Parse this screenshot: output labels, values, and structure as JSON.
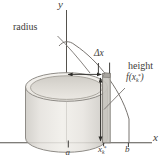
{
  "figure": {
    "axes": {
      "x_label": "x",
      "y_label": "y"
    },
    "labels": {
      "radius": "radius",
      "delta_x": "Δx",
      "height": "height",
      "fx_open": "f(x",
      "fx_sub": "k",
      "fx_sup": "*",
      "fx_close": ")",
      "a": "a",
      "xk_base": "x",
      "xk_sub": "k",
      "xk_sup": "*",
      "b": "b"
    },
    "colors": {
      "axis_line": "#55524d",
      "curve_line": "#787470",
      "arrow": "#2b2a27",
      "strip_fill": "#c8c5bf",
      "strip_edge": "#817e78",
      "cylinder_outline": "#8f8c87",
      "text": "#3e3c39",
      "background": "#ffffff"
    }
  }
}
